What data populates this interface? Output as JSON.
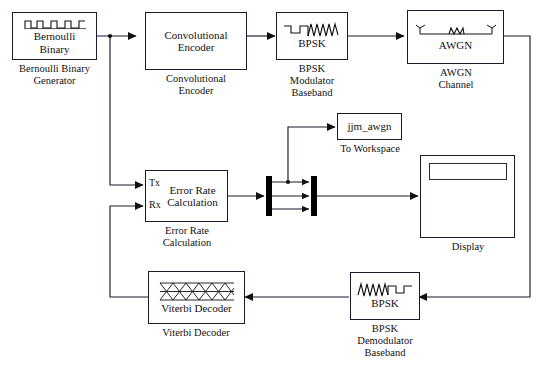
{
  "diagram": {
    "canvas": {
      "width": 544,
      "height": 379
    },
    "line_color": "#1a1a2e",
    "background": "#ffffff"
  },
  "blocks": {
    "bernoulli": {
      "label": "Bernoulli\nBinary",
      "caption": "Bernoulli Binary\nGenerator",
      "icon": "binary-pulse-train-icon"
    },
    "conv_encoder": {
      "label": "Convolutional\nEncoder",
      "caption": "Convolutional\nEncoder",
      "icon": "none"
    },
    "bpsk_mod": {
      "label": "BPSK",
      "caption": "BPSK\nModulator\nBaseband",
      "icon": "square-to-sine-wave-icon"
    },
    "awgn": {
      "label": "AWGN",
      "caption": "AWGN\nChannel",
      "icon": "antenna-noise-antenna-icon"
    },
    "to_workspace": {
      "label": "jjm_awgn",
      "caption": "To Workspace",
      "icon": "none"
    },
    "error_rate": {
      "label": "Error Rate\nCalculation",
      "caption": "Error Rate\nCalculation",
      "port_tx": "Tx",
      "port_rx": "Rx",
      "icon": "none"
    },
    "display": {
      "label": "",
      "caption": "Display",
      "icon": "numeric-readout-icon"
    },
    "viterbi": {
      "label": "Viterbi Decoder",
      "caption": "Viterbi Decoder",
      "icon": "trellis-lattice-icon"
    },
    "bpsk_demod": {
      "label": "BPSK",
      "caption": "BPSK\nDemodulator\nBaseband",
      "icon": "sine-to-square-wave-icon"
    },
    "demux": {
      "label": "",
      "caption": "",
      "icon": "demux-bar-icon"
    },
    "mux": {
      "label": "",
      "caption": "",
      "icon": "mux-bar-icon"
    }
  }
}
